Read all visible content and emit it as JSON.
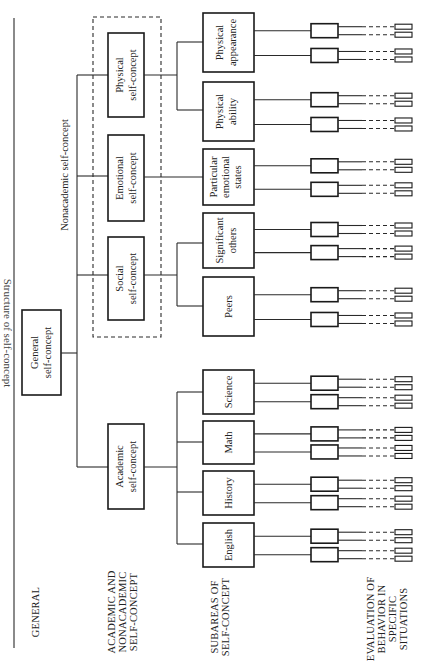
{
  "figure": {
    "title_partial": "Structure of self-concept",
    "top": {
      "label": "General self-concept",
      "lines": [
        "General",
        "self-concept"
      ]
    },
    "nonacademic_label": "Nonacademic self-concept",
    "level_labels": {
      "general": "GENERAL",
      "academic_nonacademic": [
        "ACADEMIC AND",
        "NONACADEMIC",
        "SELF-CONCEPT"
      ],
      "subareas": [
        "SUBAREAS OF",
        "SELF-CONCEPT"
      ],
      "evaluation": [
        "EVALUATION OF",
        "BEHAVIOR IN",
        "SPECIFIC",
        "SITUATIONS"
      ]
    },
    "level2": [
      {
        "id": "physical",
        "lines": [
          "Physical",
          "self-concept"
        ]
      },
      {
        "id": "emotional",
        "lines": [
          "Emotional",
          "self-concept"
        ]
      },
      {
        "id": "social",
        "lines": [
          "Social",
          "self-concept"
        ]
      },
      {
        "id": "academic",
        "lines": [
          "Academic",
          "self-concept"
        ]
      }
    ],
    "level3": [
      {
        "id": "physical-appearance",
        "parent": "physical",
        "lines": [
          "Physical",
          "appearance"
        ]
      },
      {
        "id": "physical-ability",
        "parent": "physical",
        "lines": [
          "Physical",
          "ability"
        ]
      },
      {
        "id": "particular-emotional-states",
        "parent": "emotional",
        "lines": [
          "Particular",
          "emotional",
          "states"
        ]
      },
      {
        "id": "significant-others",
        "parent": "social",
        "lines": [
          "Significant",
          "others"
        ]
      },
      {
        "id": "peers",
        "parent": "social",
        "lines": [
          "Peers"
        ]
      },
      {
        "id": "science",
        "parent": "academic",
        "lines": [
          "Science"
        ]
      },
      {
        "id": "math",
        "parent": "academic",
        "lines": [
          "Math"
        ]
      },
      {
        "id": "history",
        "parent": "academic",
        "lines": [
          "History"
        ]
      },
      {
        "id": "english",
        "parent": "academic",
        "lines": [
          "English"
        ]
      }
    ]
  }
}
